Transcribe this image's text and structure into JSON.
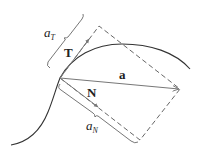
{
  "diagram": {
    "labels": {
      "tangent_vector": "T",
      "normal_vector": "N",
      "acceleration_vector": "a",
      "tangential_component_base": "a",
      "tangential_component_sub": "T",
      "normal_component_base": "a",
      "normal_component_sub": "N"
    },
    "colors": {
      "curve": "#333333",
      "vectors": "#777777",
      "dashed": "#555555",
      "bracket": "#666666",
      "text": "#222222"
    }
  }
}
